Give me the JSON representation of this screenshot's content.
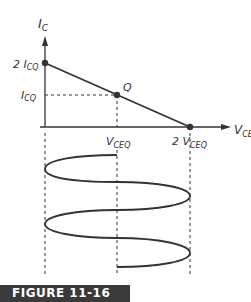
{
  "figure": {
    "caption": "FIGURE 11-16",
    "labels": {
      "y_axis": "I",
      "y_axis_sub": "C",
      "x_axis": "V",
      "x_axis_sub": "CE",
      "y_max_prefix": "2 I",
      "y_max_sub": "CQ",
      "y_mid": "I",
      "y_mid_sub": "CQ",
      "x_mid": "V",
      "x_mid_sub": "CEQ",
      "x_max_prefix": "2 V",
      "x_max_sub": "CEQ",
      "q_point": "Q"
    },
    "colors": {
      "line": "#333333",
      "caption_bg": "#3a3a3a"
    }
  }
}
